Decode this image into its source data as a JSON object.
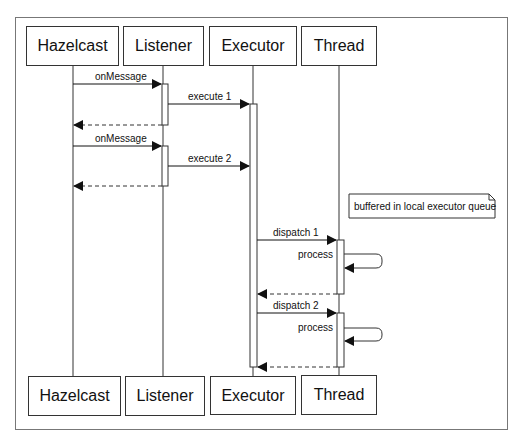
{
  "participants": [
    {
      "name": "Hazelcast",
      "x": 73
    },
    {
      "name": "Listener",
      "x": 163
    },
    {
      "name": "Executor",
      "x": 253
    },
    {
      "name": "Thread",
      "x": 339
    }
  ],
  "messages": [
    {
      "label": "onMessage",
      "from": "Hazelcast",
      "to": "Listener",
      "type": "sync"
    },
    {
      "label": "execute 1",
      "from": "Listener",
      "to": "Executor",
      "type": "sync"
    },
    {
      "label": "",
      "from": "Listener",
      "to": "Hazelcast",
      "type": "return"
    },
    {
      "label": "onMessage",
      "from": "Hazelcast",
      "to": "Listener",
      "type": "sync"
    },
    {
      "label": "execute 2",
      "from": "Listener",
      "to": "Executor",
      "type": "sync"
    },
    {
      "label": "",
      "from": "Listener",
      "to": "Hazelcast",
      "type": "return"
    },
    {
      "label": "dispatch 1",
      "from": "Executor",
      "to": "Thread",
      "type": "sync"
    },
    {
      "label": "process",
      "from": "Thread",
      "to": "Thread",
      "type": "self"
    },
    {
      "label": "",
      "from": "Thread",
      "to": "Executor",
      "type": "return"
    },
    {
      "label": "dispatch 2",
      "from": "Executor",
      "to": "Thread",
      "type": "sync"
    },
    {
      "label": "process",
      "from": "Thread",
      "to": "Thread",
      "type": "self"
    },
    {
      "label": "",
      "from": "Thread",
      "to": "Executor",
      "type": "return"
    }
  ],
  "note": {
    "text": "buffered in local executor queue"
  }
}
